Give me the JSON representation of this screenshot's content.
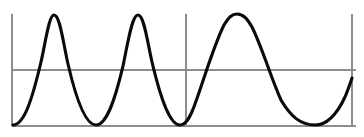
{
  "figure": {
    "name": "waveform-plot",
    "width": 364,
    "height": 137,
    "background": "#ffffff"
  },
  "colors": {
    "wave": "#0a0a0a",
    "axis": "#8d8d8d",
    "grid": "#8d8d8d",
    "background": "#ffffff"
  },
  "axes": {
    "left_axis": {
      "x": 12,
      "y_top": 14,
      "y_bottom": 126
    },
    "baseline": {
      "y": 126,
      "x_start": 12,
      "x_end": 356
    },
    "midline": {
      "y": 70,
      "x_start": 12,
      "x_end": 356
    },
    "divider": {
      "x": 186,
      "y_top": 14,
      "y_bottom": 126
    },
    "right_axis": {
      "x": 352,
      "y_top": 14,
      "y_bottom": 126
    },
    "x_range": [
      12,
      356
    ],
    "y_range": [
      126,
      14
    ],
    "grid": true,
    "tick_labels": [],
    "axis_labels": {
      "x": "",
      "y": ""
    }
  },
  "chart_data": {
    "type": "line",
    "title": "",
    "subtitle": "",
    "xlabel": "",
    "ylabel": "",
    "xlim": [
      0,
      364
    ],
    "ylim": [
      126,
      14
    ],
    "grid": true,
    "legend": [],
    "annotations": [
      {
        "name": "segment-divider",
        "type": "vline",
        "x": 186
      },
      {
        "name": "amplitude-midline",
        "type": "hline",
        "y": 70
      }
    ],
    "series": [
      {
        "name": "oscillation",
        "color": "#0a0a0a",
        "linewidth": 3.1,
        "description": "Sinusoidal wave; high frequency for the first two cycles, then lower frequency after the divider",
        "features": {
          "peaks": [
            {
              "x": 54,
              "y": 15
            },
            {
              "x": 138,
              "y": 15
            },
            {
              "x": 235,
              "y": 14
            }
          ],
          "troughs": [
            {
              "x": 96,
              "y": 125
            },
            {
              "x": 180,
              "y": 125
            },
            {
              "x": 315,
              "y": 125
            }
          ],
          "start_point": {
            "x": 13,
            "y": 125
          },
          "end_point": {
            "x": 352,
            "y": 78
          },
          "segment_1_period_px": 84,
          "segment_2_period_px": 160,
          "amplitude_px": 111,
          "baseline_y": 126,
          "peak_y": 15
        },
        "path": "M 13 125 C 24 125 32 100 41 62 C 46 40 49 15 54 15 C 60 15 63 42 68 64 C 77 103 86 125 96 125 C 106 125 114 104 123 66 C 128 42 132 15 138 15 C 144 15 147 40 152 62 C 161 100 170 125 180 125 C 186 125 190 118 195 104 C 205 76 214 45 224 25 C 229 17 232 14 237 14 C 243 14 247 18 252 27 C 262 47 271 78 281 100 C 291 117 301 125 315 125 C 328 125 338 112 345 97 C 348 90 350 84 352 78"
      }
    ]
  }
}
